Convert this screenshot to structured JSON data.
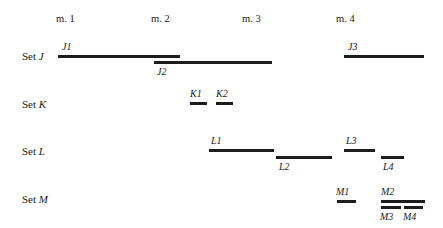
{
  "figure": {
    "width": 443,
    "height": 228,
    "background": "#ffffff",
    "bar_color": "#1c1c1c",
    "text_color": "#1a1a1a"
  },
  "measures": [
    {
      "label": "m. 1",
      "x": 56,
      "y": 14
    },
    {
      "label": "m. 2",
      "x": 151,
      "y": 14
    },
    {
      "label": "m. 3",
      "x": 242,
      "y": 14
    },
    {
      "label": "m. 4",
      "x": 336,
      "y": 14
    }
  ],
  "sets": [
    {
      "word": "Set",
      "letter": "J",
      "x": 22,
      "y": 51
    },
    {
      "word": "Set",
      "letter": "K",
      "x": 22,
      "y": 99
    },
    {
      "word": "Set",
      "letter": "L",
      "x": 22,
      "y": 146
    },
    {
      "word": "Set",
      "letter": "M",
      "x": 22,
      "y": 194
    }
  ],
  "bars": [
    {
      "id": "J1",
      "set": "J",
      "x": 58,
      "y": 55,
      "width": 122,
      "label_x": 62,
      "label_y": 42,
      "label_pos": "above"
    },
    {
      "id": "J2",
      "set": "J",
      "x": 154,
      "y": 61,
      "width": 118,
      "label_x": 157,
      "label_y": 67,
      "label_pos": "below"
    },
    {
      "id": "J3",
      "set": "J",
      "x": 344,
      "y": 55,
      "width": 80,
      "label_x": 348,
      "label_y": 42,
      "label_pos": "above"
    },
    {
      "id": "K1",
      "set": "K",
      "x": 190,
      "y": 102,
      "width": 17,
      "label_x": 190,
      "label_y": 89,
      "label_pos": "above"
    },
    {
      "id": "K2",
      "set": "K",
      "x": 216,
      "y": 102,
      "width": 17,
      "label_x": 216,
      "label_y": 89,
      "label_pos": "above"
    },
    {
      "id": "L1",
      "set": "L",
      "x": 209,
      "y": 149,
      "width": 65,
      "label_x": 211,
      "label_y": 136,
      "label_pos": "above"
    },
    {
      "id": "L2",
      "set": "L",
      "x": 276,
      "y": 156,
      "width": 56,
      "label_x": 279,
      "label_y": 162,
      "label_pos": "below"
    },
    {
      "id": "L3",
      "set": "L",
      "x": 344,
      "y": 149,
      "width": 31,
      "label_x": 346,
      "label_y": 136,
      "label_pos": "above"
    },
    {
      "id": "L4",
      "set": "L",
      "x": 381,
      "y": 156,
      "width": 23,
      "label_x": 383,
      "label_y": 162,
      "label_pos": "below"
    },
    {
      "id": "M1",
      "set": "M",
      "x": 337,
      "y": 200,
      "width": 19,
      "label_x": 336,
      "label_y": 187,
      "label_pos": "above"
    },
    {
      "id": "M2",
      "set": "M",
      "x": 381,
      "y": 200,
      "width": 44,
      "label_x": 381,
      "label_y": 187,
      "label_pos": "above"
    },
    {
      "id": "M3",
      "set": "M",
      "x": 381,
      "y": 206,
      "width": 20,
      "label_x": 380,
      "label_y": 212,
      "label_pos": "below"
    },
    {
      "id": "M4",
      "set": "M",
      "x": 404,
      "y": 206,
      "width": 19,
      "label_x": 403,
      "label_y": 212,
      "label_pos": "below"
    }
  ]
}
